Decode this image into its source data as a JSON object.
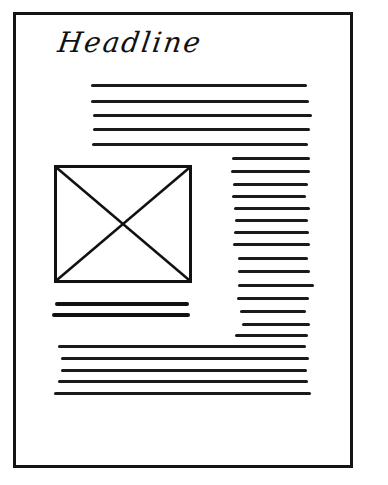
{
  "sketch": {
    "type": "wireframe",
    "headline": "Headline",
    "colors": {
      "ink": "#141414",
      "paper": "#ffffff"
    },
    "image_placeholder": {
      "icon": "image-placeholder-x-icon"
    },
    "intro_lines": [
      {
        "x": 91,
        "y": 84,
        "w": 216
      },
      {
        "x": 91,
        "y": 100,
        "w": 218
      },
      {
        "x": 93,
        "y": 114,
        "w": 219
      },
      {
        "x": 93,
        "y": 128,
        "w": 217
      },
      {
        "x": 92,
        "y": 143,
        "w": 216
      }
    ],
    "side_column_lines": [
      {
        "x": 232,
        "y": 157,
        "w": 78
      },
      {
        "x": 231,
        "y": 170,
        "w": 79
      },
      {
        "x": 233,
        "y": 183,
        "w": 75
      },
      {
        "x": 232,
        "y": 195,
        "w": 74
      },
      {
        "x": 234,
        "y": 207,
        "w": 76
      },
      {
        "x": 235,
        "y": 219,
        "w": 73
      },
      {
        "x": 234,
        "y": 231,
        "w": 75
      },
      {
        "x": 233,
        "y": 243,
        "w": 77
      },
      {
        "x": 238,
        "y": 257,
        "w": 70
      },
      {
        "x": 238,
        "y": 270,
        "w": 72
      },
      {
        "x": 238,
        "y": 284,
        "w": 76
      },
      {
        "x": 237,
        "y": 297,
        "w": 72
      },
      {
        "x": 240,
        "y": 310,
        "w": 66
      },
      {
        "x": 242,
        "y": 323,
        "w": 68
      },
      {
        "x": 235,
        "y": 334,
        "w": 73
      }
    ],
    "caption_lines": [
      {
        "x": 55,
        "y": 302,
        "w": 134
      },
      {
        "x": 52,
        "y": 313,
        "w": 138
      }
    ],
    "bottom_lines": [
      {
        "x": 58,
        "y": 345,
        "w": 248
      },
      {
        "x": 61,
        "y": 357,
        "w": 248
      },
      {
        "x": 61,
        "y": 369,
        "w": 246
      },
      {
        "x": 58,
        "y": 380,
        "w": 250
      },
      {
        "x": 54,
        "y": 392,
        "w": 257
      }
    ]
  }
}
